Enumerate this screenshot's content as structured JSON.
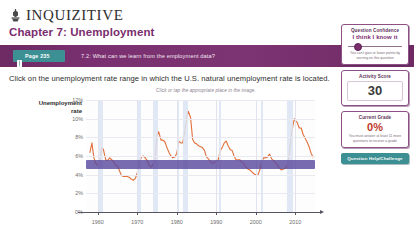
{
  "header": {
    "brand_in": "IN",
    "brand_rest": "QUIZITIVE",
    "logo_icon": "norton-seal-icon",
    "chapter": "Chapter 7: Unemployment"
  },
  "question_bar": {
    "page_badge_icon": "book-icon",
    "page_badge_label": "Page 235",
    "question_title": "7.2: What can we learn from the employment data?"
  },
  "prompt": "Click on the unemployment rate range in which the U.S. natural unemployment rate is located.",
  "chart_hint": "Click or tap the appropriate place in the image.",
  "sidebar": {
    "confidence": {
      "title": "Question Confidence",
      "value": "I think I know it",
      "note": "You can't gain or lower points by earning on this question"
    },
    "activity": {
      "title": "Activity Score",
      "value": "30"
    },
    "grade": {
      "title": "Current Grade",
      "value": "0%",
      "note": "You must answer at least 11 more questions to receive a grade"
    },
    "help_button": "Question Help/Challenge"
  },
  "colors": {
    "purple": "#7b2e6e",
    "bar_purple": "#6f2a64",
    "teal": "#3c8f92",
    "line_orange": "#e2703a",
    "band_violet": "#5b4a9e",
    "recession_blue": "#dbe4f3",
    "grade_red": "#c0392b"
  },
  "chart_data": {
    "type": "line",
    "title": "",
    "xlabel": "",
    "ylabel": "Unemployment rate",
    "ylabel_lines": [
      "Unemployment",
      "rate"
    ],
    "xlim": [
      1957,
      2015
    ],
    "ylim": [
      0,
      12
    ],
    "yticks": [
      "12%",
      "10%",
      "8%",
      "6%",
      "4%",
      "2%"
    ],
    "ytick_values": [
      12,
      10,
      8,
      6,
      4,
      2
    ],
    "zero_label": "0%",
    "xticks": [
      "1960",
      "1970",
      "1980",
      "1990",
      "2000",
      "2010"
    ],
    "xtick_values": [
      1960,
      1970,
      1980,
      1990,
      2000,
      2010
    ],
    "grid": true,
    "legend": "none",
    "annotations": {
      "selected_band_label": "natural unemployment rate range",
      "selected_band_low": 4.6,
      "selected_band_high": 5.6
    },
    "recession_bands": [
      [
        1960.3,
        1961.2
      ],
      [
        1969.9,
        1970.9
      ],
      [
        1973.9,
        1975.2
      ],
      [
        1980.0,
        1980.6
      ],
      [
        1981.6,
        1982.9
      ],
      [
        1990.6,
        1991.2
      ],
      [
        2001.2,
        2001.9
      ],
      [
        2007.9,
        2009.5
      ]
    ],
    "series": [
      {
        "name": "U.S. unemployment rate",
        "color": "#e2703a",
        "x": [
          1958.0,
          1958.5,
          1959.0,
          1959.5,
          1960.0,
          1960.5,
          1961.0,
          1961.4,
          1962.0,
          1962.5,
          1963.0,
          1963.5,
          1964.0,
          1964.5,
          1965.0,
          1965.5,
          1966.0,
          1966.5,
          1967.0,
          1967.5,
          1968.0,
          1968.5,
          1969.0,
          1969.5,
          1970.0,
          1970.5,
          1971.0,
          1971.5,
          1972.0,
          1972.5,
          1973.0,
          1973.5,
          1974.0,
          1974.5,
          1975.0,
          1975.4,
          1976.0,
          1976.5,
          1977.0,
          1977.5,
          1978.0,
          1978.5,
          1979.0,
          1979.5,
          1980.0,
          1980.5,
          1981.0,
          1981.5,
          1982.0,
          1982.5,
          1982.9,
          1983.5,
          1984.0,
          1984.5,
          1985.0,
          1985.5,
          1986.0,
          1986.5,
          1987.0,
          1987.5,
          1988.0,
          1988.5,
          1989.0,
          1989.5,
          1990.0,
          1990.5,
          1991.0,
          1991.5,
          1992.0,
          1992.5,
          1993.0,
          1993.5,
          1994.0,
          1994.5,
          1995.0,
          1995.5,
          1996.0,
          1996.5,
          1997.0,
          1997.5,
          1998.0,
          1998.5,
          1999.0,
          1999.5,
          2000.0,
          2000.5,
          2001.0,
          2001.5,
          2002.0,
          2002.5,
          2003.0,
          2003.5,
          2004.0,
          2004.5,
          2005.0,
          2005.5,
          2006.0,
          2006.5,
          2007.0,
          2007.5,
          2008.0,
          2008.5,
          2009.0,
          2009.5,
          2009.8,
          2010.0,
          2010.5,
          2011.0,
          2011.5,
          2012.0,
          2012.5,
          2013.0,
          2013.5,
          2014.0,
          2014.5
        ],
        "y": [
          6.4,
          7.4,
          5.8,
          5.2,
          5.0,
          5.4,
          6.9,
          6.7,
          5.6,
          5.5,
          5.8,
          5.6,
          5.4,
          5.0,
          4.9,
          4.4,
          3.9,
          3.8,
          3.8,
          3.8,
          3.7,
          3.5,
          3.4,
          3.6,
          4.2,
          5.1,
          5.9,
          6.0,
          5.8,
          5.5,
          5.0,
          4.8,
          5.1,
          5.6,
          8.2,
          8.6,
          7.7,
          7.7,
          7.5,
          6.9,
          6.4,
          6.0,
          5.8,
          5.9,
          6.3,
          7.6,
          7.4,
          7.4,
          8.6,
          10.1,
          10.8,
          10.1,
          7.8,
          7.4,
          7.3,
          7.1,
          7.0,
          6.9,
          6.6,
          5.9,
          5.7,
          5.4,
          5.2,
          5.3,
          5.4,
          5.6,
          6.6,
          6.9,
          7.4,
          7.6,
          7.1,
          6.7,
          6.6,
          6.0,
          5.6,
          5.6,
          5.6,
          5.3,
          5.2,
          4.8,
          4.6,
          4.5,
          4.3,
          4.1,
          4.0,
          3.9,
          4.5,
          5.4,
          5.8,
          5.8,
          5.9,
          6.2,
          5.7,
          5.5,
          5.3,
          5.0,
          4.7,
          4.5,
          4.6,
          4.7,
          5.0,
          6.2,
          8.3,
          9.5,
          10.0,
          9.8,
          9.6,
          9.0,
          9.0,
          8.3,
          7.9,
          7.5,
          7.0,
          6.3,
          5.9
        ]
      }
    ]
  }
}
